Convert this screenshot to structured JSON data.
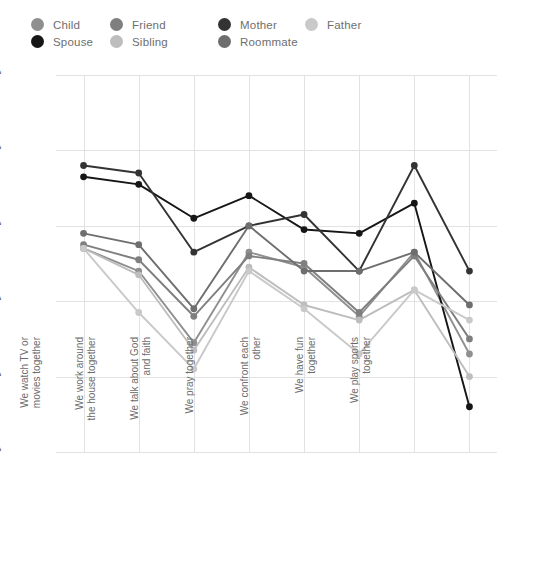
{
  "legend": {
    "items": [
      {
        "label": "Child",
        "color": "#8f8f8f",
        "col": 0,
        "row": 0
      },
      {
        "label": "Spouse",
        "color": "#161616",
        "col": 0,
        "row": 1
      },
      {
        "label": "Friend",
        "color": "#7f7f7f",
        "col": 1,
        "row": 0
      },
      {
        "label": "Sibling",
        "color": "#bdbdbd",
        "col": 1,
        "row": 1
      },
      {
        "label": "Mother",
        "color": "#333333",
        "col": 2,
        "row": 0
      },
      {
        "label": "Roommate",
        "color": "#6e6e6e",
        "col": 2,
        "row": 1
      },
      {
        "label": "Father",
        "color": "#c9c9c9",
        "col": 3,
        "row": 0
      }
    ]
  },
  "chart_data": {
    "type": "line",
    "title": "",
    "xlabel": "",
    "ylabel": "",
    "ylim": [
      0,
      100
    ],
    "grid": true,
    "legend_position": "top",
    "ytick_labels": [
      "0%",
      "20%",
      "40%",
      "60%",
      "80%",
      "100%"
    ],
    "ytick_values": [
      0,
      20,
      40,
      60,
      80,
      100
    ],
    "categories": [
      "We eat meals together",
      "We watch TV or movies together",
      "We work around the house together",
      "We talk about God and faith",
      "We pray together",
      "We confront each other",
      "We have fun together",
      "We play sports together"
    ],
    "category_lines": [
      [
        "We eat meals",
        "together"
      ],
      [
        "We watch TV or",
        "movies together"
      ],
      [
        "We work around",
        "the house together"
      ],
      [
        "We talk about God",
        "and faith"
      ],
      [
        "We pray together",
        ""
      ],
      [
        "We confront each",
        "other"
      ],
      [
        "We have fun",
        "together"
      ],
      [
        "We play sports",
        "together"
      ]
    ],
    "series": [
      {
        "name": "Child",
        "color": "#8f8f8f",
        "values": [
          54,
          48,
          29,
          53,
          49,
          36,
          53,
          26
        ]
      },
      {
        "name": "Spouse",
        "color": "#161616",
        "values": [
          73,
          71,
          62,
          68,
          59,
          58,
          66,
          12
        ]
      },
      {
        "name": "Friend",
        "color": "#7f7f7f",
        "values": [
          55,
          51,
          36,
          52,
          50,
          37,
          52,
          30
        ]
      },
      {
        "name": "Sibling",
        "color": "#bdbdbd",
        "values": [
          54,
          47,
          27,
          49,
          39,
          35,
          43,
          20
        ]
      },
      {
        "name": "Mother",
        "color": "#333333",
        "values": [
          76,
          74,
          53,
          60,
          63,
          48,
          76,
          48
        ]
      },
      {
        "name": "Roommate",
        "color": "#6e6e6e",
        "values": [
          58,
          55,
          38,
          60,
          48,
          48,
          53,
          39
        ]
      },
      {
        "name": "Father",
        "color": "#c9c9c9",
        "values": [
          54,
          37,
          22,
          48,
          38,
          26,
          43,
          35
        ]
      }
    ]
  }
}
